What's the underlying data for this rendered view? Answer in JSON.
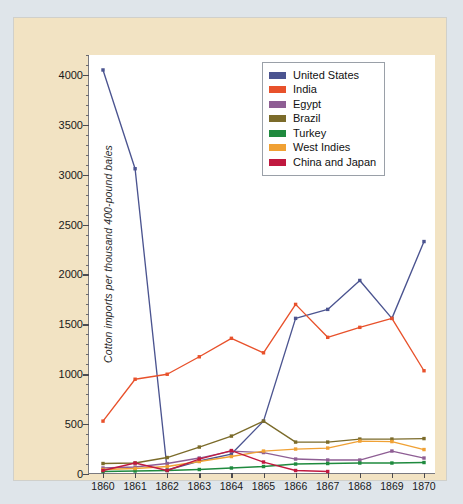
{
  "chart_data": {
    "type": "line",
    "title": "",
    "xlabel": "",
    "ylabel": "Cotton imports per thousand 400-pound bales",
    "x": [
      1860,
      1861,
      1862,
      1863,
      1864,
      1865,
      1866,
      1867,
      1868,
      1869,
      1870
    ],
    "xtick_labels": [
      "1860",
      "1861",
      "1862",
      "1863",
      "1864",
      "1865",
      "1866",
      "1867",
      "1868",
      "1869",
      "1870"
    ],
    "ytick_labels": [
      "0",
      "500",
      "1000",
      "1500",
      "2000",
      "2500",
      "3000",
      "3500",
      "4000"
    ],
    "ytick_values": [
      0,
      500,
      1000,
      1500,
      2000,
      2500,
      3000,
      3500,
      4000
    ],
    "xlim": [
      1860,
      1870
    ],
    "ylim": [
      0,
      4200
    ],
    "grid": false,
    "legend_position": "top-right",
    "minor_ticks": true,
    "markers": "square",
    "series": [
      {
        "name": "United States",
        "color": "#4b5490",
        "values": [
          4050,
          3060,
          40,
          130,
          200,
          530,
          1560,
          1650,
          1940,
          1560,
          2330
        ]
      },
      {
        "name": "India",
        "color": "#e8512b",
        "values": [
          530,
          950,
          1000,
          1175,
          1360,
          1215,
          1700,
          1370,
          1470,
          1560,
          1035
        ]
      },
      {
        "name": "Egypt",
        "color": "#8e5e94",
        "values": [
          60,
          70,
          105,
          160,
          230,
          215,
          150,
          140,
          140,
          230,
          160
        ]
      },
      {
        "name": "Brazil",
        "color": "#7b6b2a",
        "values": [
          105,
          110,
          165,
          270,
          380,
          530,
          320,
          320,
          350,
          350,
          355
        ]
      },
      {
        "name": "Turkey",
        "color": "#1f8a3e",
        "values": [
          25,
          30,
          35,
          45,
          60,
          75,
          100,
          105,
          110,
          110,
          115
        ]
      },
      {
        "name": "West Indies",
        "color": "#f0a134",
        "values": [
          45,
          55,
          75,
          125,
          175,
          230,
          250,
          260,
          330,
          325,
          245
        ]
      },
      {
        "name": "China and Japan",
        "color": "#c0193f",
        "values": [
          35,
          110,
          35,
          150,
          235,
          120,
          35,
          25,
          null,
          null,
          null
        ]
      }
    ]
  },
  "legend": {
    "items": [
      {
        "label": "United States",
        "color": "#4b5490"
      },
      {
        "label": "India",
        "color": "#e8512b"
      },
      {
        "label": "Egypt",
        "color": "#8e5e94"
      },
      {
        "label": "Brazil",
        "color": "#7b6b2a"
      },
      {
        "label": "Turkey",
        "color": "#1f8a3e"
      },
      {
        "label": "West Indies",
        "color": "#f0a134"
      },
      {
        "label": "China and Japan",
        "color": "#c0193f"
      }
    ]
  },
  "colors": {
    "page_background": "#dfe5ea",
    "figure_background": "#f2e3c3",
    "plot_background": "#ffffff",
    "axis": "#7a7a80",
    "text": "#1a1a1a"
  }
}
